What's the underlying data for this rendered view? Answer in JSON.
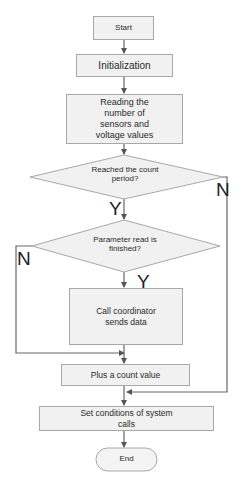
{
  "diagram": {
    "type": "flowchart",
    "nodes": {
      "start": "Start",
      "init": "Initialization",
      "read": "Reading  the number of sensors and voltage values",
      "decision1": "Reached the count period?",
      "decision2": "Parameter read is finished?",
      "call": "Call coordinator sends data",
      "plus": "Plus a count value",
      "setcond": "Set conditions  of system calls",
      "end": "End"
    },
    "branch_labels": {
      "d1_yes": "Y",
      "d1_no": "N",
      "d2_yes": "Y",
      "d2_no": "N"
    },
    "edges": [
      {
        "from": "start",
        "to": "init"
      },
      {
        "from": "init",
        "to": "read"
      },
      {
        "from": "read",
        "to": "decision1"
      },
      {
        "from": "decision1",
        "to": "decision2",
        "label": "Y"
      },
      {
        "from": "decision1",
        "to": "setcond",
        "label": "N"
      },
      {
        "from": "decision2",
        "to": "call",
        "label": "Y"
      },
      {
        "from": "decision2",
        "to": "plus",
        "label": "N"
      },
      {
        "from": "call",
        "to": "plus"
      },
      {
        "from": "plus",
        "to": "setcond"
      },
      {
        "from": "setcond",
        "to": "end"
      }
    ],
    "colors": {
      "fill": "#f1f1f1",
      "stroke": "#a8a8a8",
      "line": "#666666",
      "text": "#2a2a2a"
    }
  }
}
